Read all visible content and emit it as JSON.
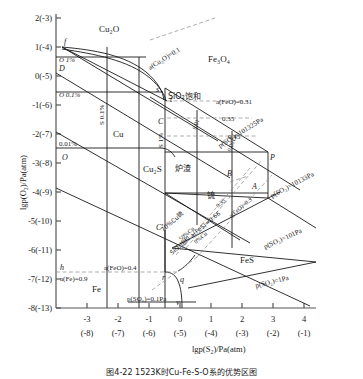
{
  "figure": {
    "axis_y_label": "lgp(O₂)/Pa(atm)",
    "axis_x_label": "lgp(S₂)/Pa(atm)",
    "caption": "图4-22  1523K时Cu-Fe-S-O系的优势区图"
  },
  "chart_data": {
    "type": "scatter",
    "xlabel": "lgp(S₂)/Pa(atm)",
    "ylabel": "lgp(O₂)/Pa(atm)",
    "xlim": [
      -4,
      4
    ],
    "ylim": [
      -8,
      2
    ],
    "grid": false,
    "legend": "none",
    "x_ticks": [
      "-3",
      "-2",
      "-1",
      "0",
      "1",
      "2",
      "3",
      "4"
    ],
    "x_ticks_alt": [
      "(-8)",
      "(-7)",
      "(-6)",
      "(-5)",
      "(-4)",
      "(-3)",
      "(-2)",
      "(-1)"
    ],
    "y_ticks": [
      "2(-3)",
      "1(-4)",
      "0(-5)",
      "-1(-6)",
      "-2(-7)",
      "-3(-8)",
      "-4(-9)",
      "-5(-10)",
      "-6(-11)",
      "-7(-12)",
      "-8(-13)"
    ],
    "phase_regions": [
      {
        "name": "Cu₂O",
        "x": -2.0,
        "y": 1.6
      },
      {
        "name": "Cu",
        "x": -2.0,
        "y": -2.1
      },
      {
        "name": "Cu₂S",
        "x": 0.0,
        "y": -3.1
      },
      {
        "name": "Fe₃O₄",
        "x": 1.3,
        "y": 0.45
      },
      {
        "name": "FeS",
        "x": 2.3,
        "y": -6.3
      },
      {
        "name": "Fe",
        "x": -2.2,
        "y": -7.3
      },
      {
        "name": "炉渣",
        "x": 0.85,
        "y": -2.6
      },
      {
        "name": "锍",
        "x": 1.75,
        "y": -3.6
      }
    ],
    "labeled_points": [
      "f",
      "D",
      "O",
      "s",
      "t",
      "C",
      "C'",
      "O",
      "B",
      "A",
      "P",
      "h",
      "r",
      "q",
      "v"
    ],
    "iso_activity_lines": [
      "a(Cu₂O)=0.1",
      "a(FeO)=0.31",
      "0.35",
      "0.45",
      "a(FeO)=0.4",
      "a(Fe)=0.9",
      "a(FeO)=0.3",
      "0.01",
      "0.001",
      "0.35"
    ],
    "iso_pressure_lines": [
      "p(SO₂)=101325Pa",
      "p(SO₂)=10133Pa",
      "p(SO₂)=101Pa",
      "p(SO₂)=1Pa",
      "p(SO₂)=0.1Pa"
    ],
    "composition_lines": [
      "O 1%",
      "O 0.1%",
      "0.01%",
      "S 0.1%",
      "S 1%",
      "70%Cu锍",
      "50%Cu",
      "0%Cu"
    ],
    "saturation_lines": [
      "SiO₂饱和",
      "SiO₂饱和 a(FeS)=0.66"
    ]
  },
  "labels": {
    "region_cu2o": "Cu₂O",
    "region_cu": "Cu",
    "region_cu2s": "Cu₂S",
    "region_fe3o4": "Fe₃O₄",
    "region_fes": "FeS",
    "region_fe": "Fe",
    "region_slag": "炉渣",
    "region_matte": "锍",
    "o_1pct": "O 1%",
    "o_01pct": "O 0.1%",
    "pct_001": "0.01%",
    "s_01pct": "S 0.1%",
    "s_1pct": "S 1%",
    "a_cu2o": "a(Cu₂O)=0.1",
    "sio2_sat": "SiO₂饱和",
    "a_feo_031": "a(FeO)=0.31",
    "v_035": "0.35",
    "v_045": "0.45",
    "v_001": "0.01",
    "v_0001": "0.001",
    "v_035b": "0.35",
    "a_feo_04": "a(FeO)=0.4",
    "a_fe_09": "a(Fe)=0.9",
    "a_feo_03": "a(FeO)=0.3",
    "p_101325": "p(SO₂)=101325Pa",
    "p_10133": "p(SO₂)=10133Pa",
    "p_101": "p(SO₂)=101Pa",
    "p_1": "p(SO₂)=1Pa",
    "p_01": "p(SO₂)=0.1Pa",
    "cu70": "70%Cu锍",
    "cu50": "50%Cu",
    "cu0": "0%Cu",
    "sio2_fes": "SiO₂饱和 a(FeS)=0.66",
    "pt_f": "f",
    "pt_D": "D",
    "pt_O1": "O",
    "pt_O2": "O",
    "pt_s": "s",
    "pt_t": "t",
    "pt_C": "C",
    "pt_Cp": "C'",
    "pt_B": "B",
    "pt_A": "A",
    "pt_P": "P",
    "pt_h": "h",
    "pt_r": "r",
    "pt_q": "q",
    "pt_v": "v"
  },
  "yticks": [
    {
      "t": "2(-3)",
      "y": 18
    },
    {
      "t": "1(-4)",
      "y": 47
    },
    {
      "t": "0(-5)",
      "y": 76
    },
    {
      "t": "-1(-6)",
      "y": 105
    },
    {
      "t": "-2(-7)",
      "y": 134
    },
    {
      "t": "-3(-8)",
      "y": 163
    },
    {
      "t": "-4(-9)",
      "y": 192
    },
    {
      "t": "-5(-10)",
      "y": 221
    },
    {
      "t": "-6(-11)",
      "y": 250
    },
    {
      "t": "-7(-12)",
      "y": 279
    },
    {
      "t": "-8(-13)",
      "y": 308
    }
  ],
  "xticks": [
    {
      "t": "-3",
      "a": "(-8)",
      "x": 87
    },
    {
      "t": "-2",
      "a": "(-7)",
      "x": 118
    },
    {
      "t": "-1",
      "a": "(-6)",
      "x": 149
    },
    {
      "t": "0",
      "a": "(-5)",
      "x": 180
    },
    {
      "t": "1",
      "a": "(-4)",
      "x": 211
    },
    {
      "t": "2",
      "a": "(-3)",
      "x": 242
    },
    {
      "t": "3",
      "a": "(-2)",
      "x": 273
    },
    {
      "t": "4",
      "a": "(-1)",
      "x": 304
    }
  ]
}
